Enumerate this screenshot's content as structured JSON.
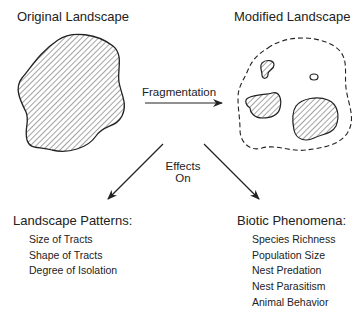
{
  "diagram": {
    "original": {
      "label": "Original Landscape"
    },
    "modified": {
      "label": "Modified Landscape"
    },
    "process": {
      "label": "Fragmentation"
    },
    "effects": {
      "line1": "Effects",
      "line2": "On"
    },
    "landscape_patterns": {
      "heading": "Landscape Patterns:",
      "items": [
        "Size of Tracts",
        "Shape of Tracts",
        "Degree of Isolation"
      ]
    },
    "biotic_phenomena": {
      "heading": "Biotic Phenomena:",
      "items": [
        "Species Richness",
        "Population Size",
        "Nest Predation",
        "Nest Parasitism",
        "Animal Behavior"
      ]
    },
    "colors": {
      "ink": "#222222",
      "background": "#ffffff"
    }
  }
}
